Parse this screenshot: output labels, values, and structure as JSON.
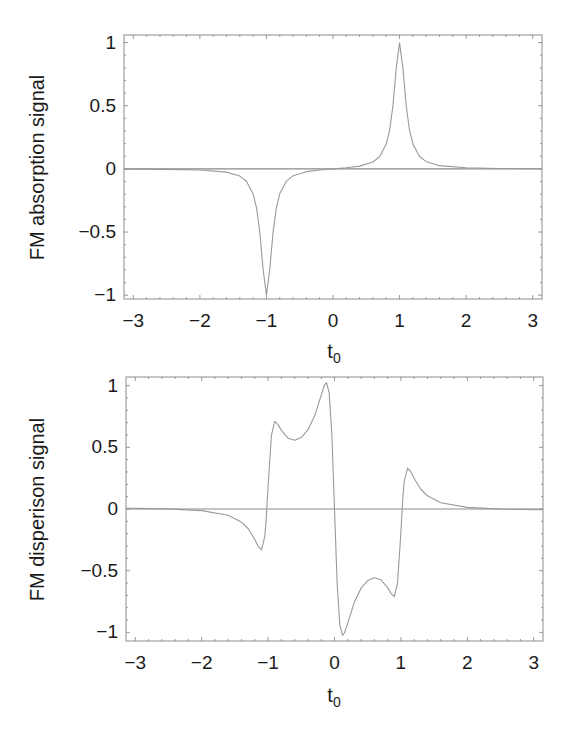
{
  "chart_data": [
    {
      "type": "line",
      "title": "",
      "xlabel": "t0",
      "xlabel_main": "t",
      "xlabel_sub": "0",
      "ylabel": "FM absorption signal",
      "xlim": [
        -3.14,
        3.14
      ],
      "ylim": [
        -1.03,
        1.06
      ],
      "xticks": [
        -3,
        -2,
        -1,
        0,
        1,
        2,
        3
      ],
      "xtick_labels": [
        "−3",
        "−2",
        "−1",
        "0",
        "1",
        "2",
        "3"
      ],
      "yticks": [
        1,
        0.5,
        0,
        -0.5,
        -1
      ],
      "ytick_labels": [
        "1",
        "0.5",
        "0",
        "−0.5",
        "−1"
      ],
      "grid": false,
      "legend": null,
      "zero_line": true,
      "series": [
        {
          "name": "FM absorption signal",
          "color": "#9a9a9a",
          "x": [
            -3.14,
            -3,
            -2.5,
            -2,
            -1.6,
            -1.4,
            -1.3,
            -1.2,
            -1.15,
            -1.1,
            -1.05,
            -1.0,
            -0.95,
            -0.9,
            -0.85,
            -0.8,
            -0.7,
            -0.6,
            -0.4,
            -0.2,
            0,
            0.2,
            0.4,
            0.6,
            0.7,
            0.8,
            0.85,
            0.9,
            0.95,
            1.0,
            1.05,
            1.1,
            1.15,
            1.2,
            1.3,
            1.4,
            1.6,
            2,
            2.5,
            3,
            3.14
          ],
          "y": [
            -0.0017,
            -0.0019,
            -0.0036,
            -0.0088,
            -0.0255,
            -0.057,
            -0.098,
            -0.198,
            -0.306,
            -0.498,
            -0.798,
            -0.9975,
            -0.797,
            -0.497,
            -0.305,
            -0.197,
            -0.0965,
            -0.055,
            -0.022,
            -0.0085,
            0,
            0.0085,
            0.022,
            0.055,
            0.0965,
            0.197,
            0.305,
            0.497,
            0.797,
            0.9975,
            0.798,
            0.498,
            0.306,
            0.198,
            0.098,
            0.057,
            0.0255,
            0.0088,
            0.0036,
            0.0019,
            0.0017
          ]
        }
      ]
    },
    {
      "type": "line",
      "title": "",
      "xlabel": "t0",
      "xlabel_main": "t",
      "xlabel_sub": "0",
      "ylabel": "FM disperison signal",
      "xlim": [
        -3.14,
        3.14
      ],
      "ylim": [
        -1.07,
        1.07
      ],
      "xticks": [
        -3,
        -2,
        -1,
        0,
        1,
        2,
        3
      ],
      "xtick_labels": [
        "−3",
        "−2",
        "−1",
        "0",
        "1",
        "2",
        "3"
      ],
      "yticks": [
        1,
        0.5,
        0,
        -0.5,
        -1
      ],
      "ytick_labels": [
        "1",
        "0.5",
        "0",
        "−0.5",
        "−1"
      ],
      "grid": false,
      "legend": null,
      "zero_line": true,
      "series": [
        {
          "name": "FM dispersion signal",
          "color": "#9a9a9a",
          "x": [
            -3.14,
            -3,
            -2.5,
            -2,
            -1.6,
            -1.4,
            -1.3,
            -1.2,
            -1.15,
            -1.1,
            -1.05,
            -1.03,
            -1.0,
            -0.95,
            -0.9,
            -0.85,
            -0.8,
            -0.7,
            -0.6,
            -0.5,
            -0.4,
            -0.3,
            -0.2,
            -0.15,
            -0.12,
            -0.08,
            -0.04,
            0,
            0.04,
            0.08,
            0.12,
            0.15,
            0.2,
            0.3,
            0.4,
            0.5,
            0.6,
            0.7,
            0.8,
            0.85,
            0.9,
            0.95,
            1.0,
            1.03,
            1.05,
            1.1,
            1.15,
            1.2,
            1.3,
            1.4,
            1.6,
            2,
            2.5,
            3,
            3.14
          ],
          "y": [
            0.0055,
            0.005,
            0.001,
            -0.013,
            -0.051,
            -0.107,
            -0.16,
            -0.247,
            -0.302,
            -0.332,
            -0.223,
            -0.0945,
            0.187,
            0.598,
            0.71,
            0.684,
            0.638,
            0.574,
            0.558,
            0.58,
            0.642,
            0.753,
            0.923,
            1.005,
            1.024,
            0.939,
            0.608,
            0,
            -0.608,
            -0.939,
            -1.024,
            -1.005,
            -0.923,
            -0.753,
            -0.642,
            -0.58,
            -0.558,
            -0.574,
            -0.638,
            -0.684,
            -0.71,
            -0.598,
            -0.187,
            0.0945,
            0.223,
            0.332,
            0.302,
            0.247,
            0.16,
            0.107,
            0.051,
            0.013,
            -0.001,
            -0.005,
            -0.0055
          ]
        }
      ]
    }
  ],
  "panels": [
    {
      "ylabel": "FM absorption signal",
      "xlabel_main": "t",
      "xlabel_sub": "0",
      "ytick_labels": [
        "1",
        "0.5",
        "0",
        "−0.5",
        "−1"
      ],
      "xtick_labels": [
        "−3",
        "−2",
        "−1",
        "0",
        "1",
        "2",
        "3"
      ]
    },
    {
      "ylabel": "FM disperison signal",
      "xlabel_main": "t",
      "xlabel_sub": "0",
      "ytick_labels": [
        "1",
        "0.5",
        "0",
        "−0.5",
        "−1"
      ],
      "xtick_labels": [
        "−3",
        "−2",
        "−1",
        "0",
        "1",
        "2",
        "3"
      ]
    }
  ]
}
